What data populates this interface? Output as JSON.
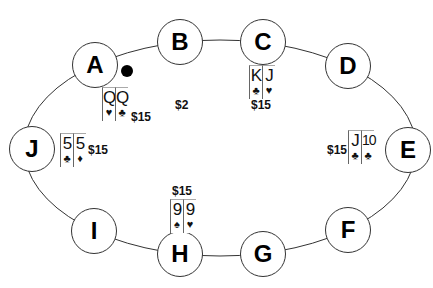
{
  "diagram": {
    "type": "poker-table",
    "pot": "$2",
    "dealer_button_seat": "A",
    "seats": [
      {
        "label": "A",
        "cards": [
          {
            "rank": "Q",
            "suit": "♥"
          },
          {
            "rank": "Q",
            "suit": "♣"
          }
        ],
        "bet": "$15"
      },
      {
        "label": "B",
        "cards": [],
        "bet": ""
      },
      {
        "label": "C",
        "cards": [
          {
            "rank": "K",
            "suit": "♣"
          },
          {
            "rank": "J",
            "suit": "♥"
          }
        ],
        "bet": "$15"
      },
      {
        "label": "D",
        "cards": [],
        "bet": ""
      },
      {
        "label": "E",
        "cards": [
          {
            "rank": "J",
            "suit": "♣"
          },
          {
            "rank": "10",
            "suit": "♣"
          }
        ],
        "bet": "$15"
      },
      {
        "label": "F",
        "cards": [],
        "bet": ""
      },
      {
        "label": "G",
        "cards": [],
        "bet": ""
      },
      {
        "label": "H",
        "cards": [
          {
            "rank": "9",
            "suit": "♠"
          },
          {
            "rank": "9",
            "suit": "♥"
          }
        ],
        "bet": "$15"
      },
      {
        "label": "I",
        "cards": [],
        "bet": ""
      },
      {
        "label": "J",
        "cards": [
          {
            "rank": "5",
            "suit": "♣"
          },
          {
            "rank": "5",
            "suit": "♦"
          }
        ],
        "bet": "$15"
      }
    ]
  }
}
